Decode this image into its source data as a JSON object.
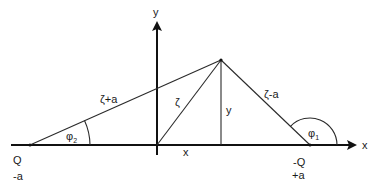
{
  "diagram": {
    "axes": {
      "x_label": "x",
      "y_label": "y"
    },
    "points": {
      "left_charge": {
        "name": "Q",
        "position": "-a"
      },
      "right_charge": {
        "name": "-Q",
        "position": "+a"
      }
    },
    "segments": {
      "left_distance": "ζ+a",
      "origin_distance": "ζ",
      "right_distance": "ζ-a",
      "height": "y",
      "base": "x"
    },
    "angles": {
      "phi2": {
        "symbol": "φ",
        "subscript": "2"
      },
      "phi1": {
        "symbol": "φ",
        "subscript": "1"
      }
    }
  }
}
